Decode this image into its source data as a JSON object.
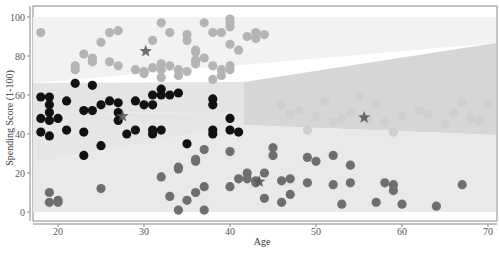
{
  "chart_data": {
    "type": "scatter",
    "title": "",
    "xlabel": "Age",
    "ylabel": "Spending Score (1-100)",
    "xlim": [
      17,
      71
    ],
    "ylim": [
      -4,
      106
    ],
    "x_ticks": [
      20,
      30,
      40,
      50,
      60,
      70
    ],
    "y_ticks": [
      0,
      20,
      40,
      60,
      80,
      100
    ],
    "grid": false,
    "legend": null,
    "background_regions": [
      {
        "name": "cluster-high-spending-region",
        "color": "#f2f2f2"
      },
      {
        "name": "cluster-mid-young-region",
        "color": "#e4e4e4"
      },
      {
        "name": "cluster-mid-old-region",
        "color": "#d6d6d6"
      },
      {
        "name": "cluster-low-spending-region",
        "color": "#e8e8e8"
      }
    ],
    "series": [
      {
        "name": "Cluster 1 (high spending, young)",
        "color": "#b4b4b4",
        "points": [
          [
            18,
            92
          ],
          [
            22,
            75
          ],
          [
            22,
            73
          ],
          [
            23,
            81
          ],
          [
            24,
            77
          ],
          [
            24,
            79
          ],
          [
            26,
            77
          ],
          [
            27,
            75
          ],
          [
            25,
            87
          ],
          [
            26,
            92
          ],
          [
            27,
            93
          ],
          [
            29,
            73
          ],
          [
            30,
            71
          ],
          [
            31,
            88
          ],
          [
            32,
            97
          ],
          [
            32,
            69
          ],
          [
            32,
            73
          ],
          [
            33,
            75
          ],
          [
            34,
            73
          ],
          [
            35,
            91
          ],
          [
            35,
            88
          ],
          [
            36,
            78
          ],
          [
            36,
            83
          ],
          [
            36,
            76
          ],
          [
            36,
            82
          ],
          [
            37,
            97
          ],
          [
            37,
            79
          ],
          [
            38,
            75
          ],
          [
            39,
            73
          ],
          [
            39,
            70
          ],
          [
            38,
            92
          ],
          [
            39,
            92
          ],
          [
            40,
            86
          ],
          [
            40,
            95
          ],
          [
            40,
            97
          ],
          [
            40,
            73
          ],
          [
            40,
            75
          ],
          [
            40,
            99
          ],
          [
            41,
            83
          ],
          [
            42,
            90
          ],
          [
            43,
            92
          ],
          [
            43,
            89
          ],
          [
            44,
            91
          ],
          [
            30,
            72
          ],
          [
            31,
            74
          ],
          [
            32,
            76
          ],
          [
            33,
            92
          ],
          [
            34,
            70
          ],
          [
            35,
            72
          ],
          [
            38,
            68
          ]
        ]
      },
      {
        "name": "Cluster 2 (mid spending, young)",
        "color": "#111111",
        "points": [
          [
            18,
            59
          ],
          [
            18,
            48
          ],
          [
            18,
            41
          ],
          [
            19,
            59
          ],
          [
            19,
            55
          ],
          [
            19,
            51
          ],
          [
            19,
            47
          ],
          [
            19,
            39
          ],
          [
            20,
            48
          ],
          [
            21,
            42
          ],
          [
            21,
            57
          ],
          [
            22,
            66
          ],
          [
            23,
            52
          ],
          [
            23,
            41
          ],
          [
            23,
            29
          ],
          [
            24,
            52
          ],
          [
            24,
            65
          ],
          [
            25,
            55
          ],
          [
            25,
            34
          ],
          [
            26,
            57
          ],
          [
            27,
            51
          ],
          [
            27,
            47
          ],
          [
            27,
            56
          ],
          [
            28,
            40
          ],
          [
            29,
            42
          ],
          [
            29,
            57
          ],
          [
            30,
            55
          ],
          [
            31,
            42
          ],
          [
            31,
            40
          ],
          [
            31,
            60
          ],
          [
            31,
            55
          ],
          [
            32,
            42
          ],
          [
            32,
            63
          ],
          [
            32,
            60
          ],
          [
            33,
            60
          ],
          [
            34,
            61
          ],
          [
            35,
            35
          ],
          [
            38,
            55
          ],
          [
            38,
            42
          ],
          [
            38,
            40
          ],
          [
            38,
            58
          ],
          [
            40,
            42
          ],
          [
            40,
            48
          ],
          [
            41,
            41
          ]
        ]
      },
      {
        "name": "Cluster 3 (mid spending, older)",
        "color": "#cfcfcf",
        "points": [
          [
            46,
            55
          ],
          [
            47,
            50
          ],
          [
            48,
            52
          ],
          [
            49,
            42
          ],
          [
            50,
            49
          ],
          [
            51,
            57
          ],
          [
            52,
            46
          ],
          [
            53,
            48
          ],
          [
            54,
            51
          ],
          [
            55,
            59
          ],
          [
            56,
            47
          ],
          [
            57,
            55
          ],
          [
            58,
            46
          ],
          [
            59,
            41
          ],
          [
            60,
            49
          ],
          [
            62,
            52
          ],
          [
            63,
            50
          ],
          [
            65,
            45
          ],
          [
            66,
            51
          ],
          [
            67,
            56
          ],
          [
            68,
            48
          ],
          [
            69,
            47
          ],
          [
            70,
            55
          ]
        ]
      },
      {
        "name": "Cluster 4 (low spending)",
        "color": "#6e6e6e",
        "points": [
          [
            19,
            10
          ],
          [
            19,
            5
          ],
          [
            20,
            5
          ],
          [
            20,
            6
          ],
          [
            25,
            12
          ],
          [
            32,
            18
          ],
          [
            33,
            8
          ],
          [
            34,
            1
          ],
          [
            34,
            22
          ],
          [
            34,
            23
          ],
          [
            35,
            6
          ],
          [
            36,
            10
          ],
          [
            36,
            26
          ],
          [
            36,
            27
          ],
          [
            37,
            1
          ],
          [
            37,
            13
          ],
          [
            37,
            32
          ],
          [
            40,
            13
          ],
          [
            40,
            31
          ],
          [
            41,
            17
          ],
          [
            42,
            17
          ],
          [
            42,
            20
          ],
          [
            43,
            15
          ],
          [
            43,
            16
          ],
          [
            44,
            20
          ],
          [
            44,
            7
          ],
          [
            45,
            33
          ],
          [
            45,
            29
          ],
          [
            46,
            16
          ],
          [
            46,
            5
          ],
          [
            47,
            17
          ],
          [
            47,
            9
          ],
          [
            49,
            28
          ],
          [
            49,
            15
          ],
          [
            50,
            26
          ],
          [
            52,
            29
          ],
          [
            52,
            14
          ],
          [
            53,
            4
          ],
          [
            54,
            24
          ],
          [
            54,
            15
          ],
          [
            57,
            5
          ],
          [
            58,
            15
          ],
          [
            59,
            14
          ],
          [
            59,
            11
          ],
          [
            60,
            4
          ],
          [
            64,
            3
          ],
          [
            67,
            14
          ]
        ]
      }
    ],
    "centroids": [
      {
        "cluster": 1,
        "age": 30.2,
        "score": 82.4
      },
      {
        "cluster": 2,
        "age": 27.5,
        "score": 49.1
      },
      {
        "cluster": 3,
        "age": 55.6,
        "score": 48.5
      },
      {
        "cluster": 4,
        "age": 43.4,
        "score": 15.5
      }
    ],
    "centroid_color": "#555555",
    "centroid_marker": "star"
  }
}
